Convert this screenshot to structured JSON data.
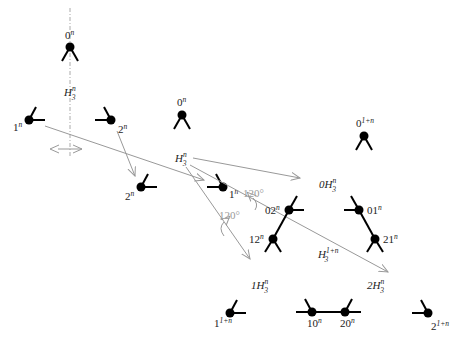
{
  "diagram": {
    "colors": {
      "node": "#000000",
      "arrow": "#999999",
      "text": "#222222",
      "angle_text": "#999999",
      "dashed_axis": "#aaaaaa"
    },
    "groups": [
      {
        "id": "left",
        "center_label": "H_3^n",
        "nodes": [
          {
            "label": "0^n"
          },
          {
            "label": "1^n"
          },
          {
            "label": "2^n"
          }
        ]
      },
      {
        "id": "middle",
        "center_label": "H_3^n",
        "nodes": [
          {
            "label": "0^n"
          },
          {
            "label": "2^n"
          },
          {
            "label": "1^n"
          }
        ]
      },
      {
        "id": "right",
        "center_label": "H_3^{1+n}",
        "subgroups": [
          {
            "label": "0H_3^n",
            "nodes": [
              {
                "label": "0^{1+n}"
              },
              {
                "label": "02^n"
              },
              {
                "label": "01^n"
              }
            ]
          },
          {
            "label": "1H_3^n",
            "nodes": [
              {
                "label": "12^n"
              },
              {
                "label": "1^{1+n}"
              },
              {
                "label": "10^n"
              }
            ]
          },
          {
            "label": "2H_3^n",
            "nodes": [
              {
                "label": "21^n"
              },
              {
                "label": "20^n"
              },
              {
                "label": "2^{1+n}"
              }
            ]
          }
        ]
      }
    ],
    "angles": [
      "120°",
      "120°"
    ],
    "text": {
      "left_0": "0",
      "left_1": "1",
      "left_2": "2",
      "mid_0": "0",
      "mid_1": "1",
      "mid_2": "2",
      "n": "n",
      "one_plus_n": "1+n",
      "three": "3",
      "H": "H",
      "r_0": "0",
      "r_02": "02",
      "r_01": "01",
      "r_12": "12",
      "r_21": "21",
      "r_1": "1",
      "r_10": "10",
      "r_20": "20",
      "r_2": "2",
      "sub_0": "0",
      "sub_1": "1",
      "sub_2": "2",
      "angle1": "120°",
      "angle2": "120°"
    }
  }
}
